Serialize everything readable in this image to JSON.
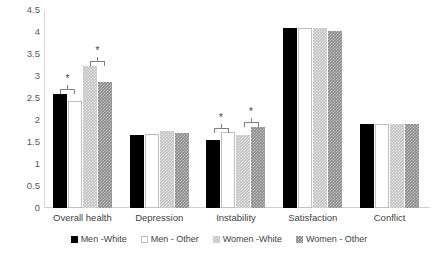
{
  "chart_data": {
    "type": "bar",
    "title": "",
    "xlabel": "",
    "ylabel": "",
    "ylim": [
      0,
      4.5
    ],
    "ytick_labels": [
      "4.5",
      "4",
      "3.5",
      "3",
      "2.5",
      "2",
      "1.5",
      "1",
      "0.5",
      "0"
    ],
    "ytick_values": [
      4.5,
      4,
      3.5,
      3,
      2.5,
      2,
      1.5,
      1,
      0.5,
      0
    ],
    "grid": false,
    "legend_position": "bottom",
    "categories": [
      "Overall health",
      "Depression",
      "Instability",
      "Satisfaction",
      "Conflict"
    ],
    "series": [
      {
        "name": "Men -White",
        "fill": "solid-black",
        "color": "#000000",
        "values": [
          2.6,
          1.65,
          1.55,
          4.1,
          1.92
        ]
      },
      {
        "name": "Men - Other",
        "fill": "open-white",
        "color": "#ffffff",
        "values": [
          2.43,
          1.68,
          1.72,
          4.1,
          1.9
        ]
      },
      {
        "name": "Women -White",
        "fill": "light-gray-checker",
        "color": "#c2c2c2",
        "values": [
          3.22,
          1.75,
          1.67,
          4.1,
          1.9
        ]
      },
      {
        "name": "Women - Other",
        "fill": "gray-checker",
        "color": "#8c8c8c",
        "values": [
          2.87,
          1.7,
          1.85,
          4.02,
          1.92
        ]
      }
    ],
    "annotations": [
      {
        "label": "*",
        "category": "Overall health",
        "spans": [
          1,
          2
        ],
        "top_value": 2.85
      },
      {
        "label": "*",
        "category": "Overall health",
        "spans": [
          3,
          4
        ],
        "top_value": 3.48
      },
      {
        "label": "*",
        "category": "Instability",
        "spans": [
          1,
          2
        ],
        "top_value": 1.96
      },
      {
        "label": "*",
        "category": "Instability",
        "spans": [
          3,
          4
        ],
        "top_value": 2.1
      }
    ]
  },
  "legend": {
    "items": [
      {
        "label": "Men -White"
      },
      {
        "label": "Men - Other"
      },
      {
        "label": "Women -White"
      },
      {
        "label": "Women - Other"
      }
    ]
  }
}
